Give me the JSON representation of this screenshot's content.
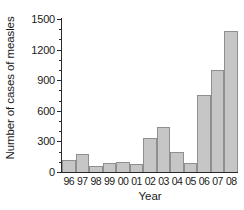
{
  "chart_data": {
    "type": "bar",
    "title": "",
    "xlabel": "Year",
    "ylabel": "Number of cases of measles",
    "categories": [
      "96",
      "97",
      "98",
      "99",
      "00",
      "01",
      "02",
      "03",
      "04",
      "05",
      "06",
      "07",
      "08"
    ],
    "values": [
      120,
      175,
      60,
      90,
      95,
      75,
      330,
      440,
      195,
      85,
      755,
      1000,
      1380
    ],
    "ylim": [
      0,
      1500
    ],
    "y_ticks": [
      0,
      300,
      600,
      900,
      1200,
      1500
    ],
    "y_tick_labels": [
      "0",
      "300",
      "600",
      "900",
      "1200",
      "1500"
    ],
    "y_minor_tick_interval": 100,
    "grid": false,
    "legend": null,
    "bar_fill_color": "#c6c6c6",
    "bar_edge_color": "#8f8f8f",
    "axis_color": "#2b2b2b"
  }
}
